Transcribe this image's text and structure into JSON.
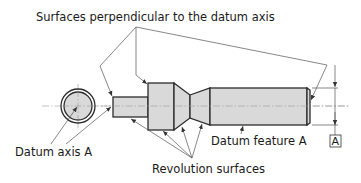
{
  "diagram": {
    "labels": {
      "perpendicular_surfaces": "Surfaces perpendicular to the datum axis",
      "datum_axis": "Datum axis A",
      "revolution_surfaces": "Revolution surfaces",
      "datum_feature": "Datum feature A",
      "datum_box": "A"
    },
    "colors": {
      "part_fill": "#d9d9d9",
      "outline": "#2b2b2b",
      "leader": "#555555",
      "centerline": "#9a9a9a",
      "text": "#1a1a1a"
    }
  }
}
